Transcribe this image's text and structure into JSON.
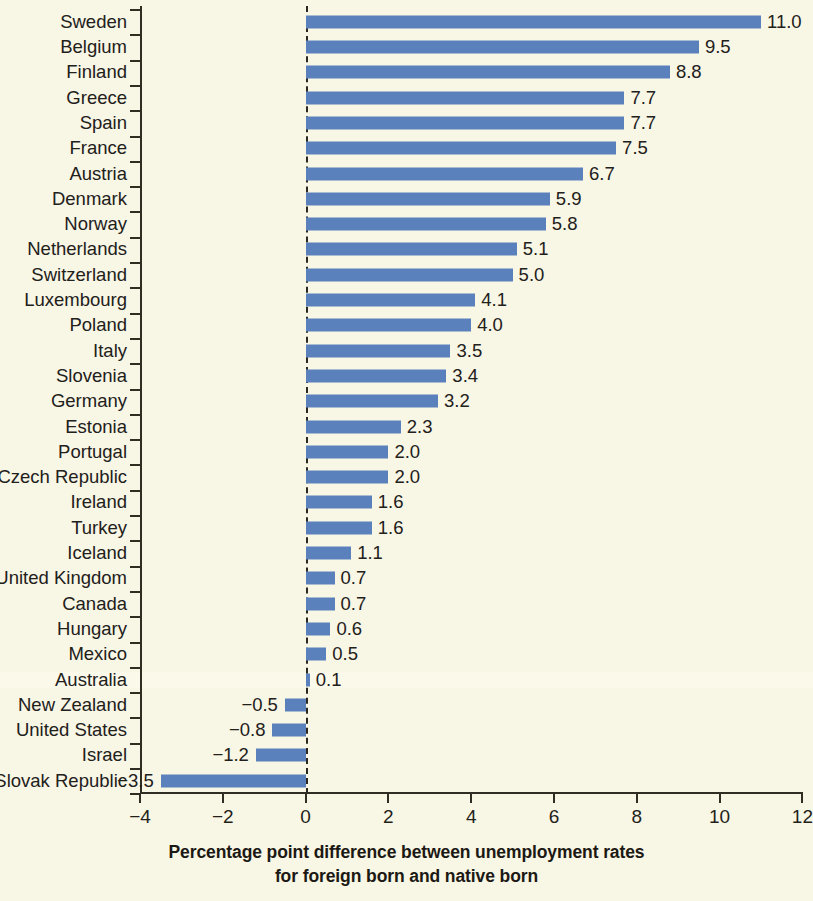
{
  "chart_data": {
    "type": "bar",
    "orientation": "horizontal",
    "title": "",
    "xlabel": "Percentage point difference between unemployment rates for foreign born and native born",
    "ylabel": "",
    "xlim": [
      -4,
      12
    ],
    "xticks": [
      -4,
      -2,
      0,
      2,
      4,
      6,
      8,
      10,
      12
    ],
    "xtick_labels": [
      "−4",
      "−2",
      "0",
      "2",
      "4",
      "6",
      "8",
      "10",
      "12"
    ],
    "grid": false,
    "legend": null,
    "zero_reference_line": true,
    "bar_color": "#5b81bd",
    "background_color": "#f8f6e4",
    "categories": [
      "Sweden",
      "Belgium",
      "Finland",
      "Greece",
      "Spain",
      "France",
      "Austria",
      "Denmark",
      "Norway",
      "Netherlands",
      "Switzerland",
      "Luxembourg",
      "Poland",
      "Italy",
      "Slovenia",
      "Germany",
      "Estonia",
      "Portugal",
      "Czech Republic",
      "Ireland",
      "Turkey",
      "Iceland",
      "United Kingdom",
      "Canada",
      "Hungary",
      "Mexico",
      "Australia",
      "New Zealand",
      "United States",
      "Israel",
      "Slovak Republic"
    ],
    "values": [
      11.0,
      9.5,
      8.8,
      7.7,
      7.7,
      7.5,
      6.7,
      5.9,
      5.8,
      5.1,
      5.0,
      4.1,
      4.0,
      3.5,
      3.4,
      3.2,
      2.3,
      2.0,
      2.0,
      1.6,
      1.6,
      1.1,
      0.7,
      0.7,
      0.6,
      0.5,
      0.1,
      -0.5,
      -0.8,
      -1.2,
      -3.5
    ],
    "value_labels": [
      "11.0",
      "9.5",
      "8.8",
      "7.7",
      "7.7",
      "7.5",
      "6.7",
      "5.9",
      "5.8",
      "5.1",
      "5.0",
      "4.1",
      "4.0",
      "3.5",
      "3.4",
      "3.2",
      "2.3",
      "2.0",
      "2.0",
      "1.6",
      "1.6",
      "1.1",
      "0.7",
      "0.7",
      "0.6",
      "0.5",
      "0.1",
      "−0.5",
      "−0.8",
      "−1.2",
      "−3.5"
    ]
  },
  "caption": {
    "line1": "Percentage point difference between unemployment rates",
    "line2": "for foreign born and native born"
  }
}
